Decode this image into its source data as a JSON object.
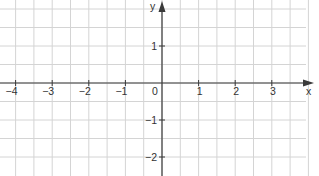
{
  "figure": {
    "type": "coordinate-plane",
    "x_axis": {
      "label": "x",
      "ticks": [
        "−4",
        "−3",
        "−2",
        "−1",
        "1",
        "2",
        "3"
      ],
      "values": [
        -4,
        -3,
        -2,
        -1,
        1,
        2,
        3
      ]
    },
    "y_axis": {
      "label": "y",
      "ticks": [
        "1",
        "−1",
        "−2"
      ],
      "values": [
        1,
        -1,
        -2
      ]
    },
    "origin_label": "0",
    "grid_step": 0.5,
    "x_range": [
      -4.4,
      4.2
    ],
    "y_range": [
      -2.2,
      2.2
    ]
  },
  "colors": {
    "grid": "#d4d4d4",
    "axis": "#3a3a3a",
    "text": "#333333",
    "background": "#ffffff"
  }
}
